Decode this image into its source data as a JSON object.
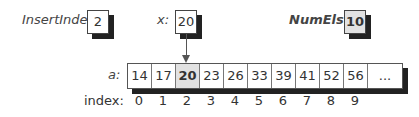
{
  "variables": [
    {
      "name": "InsertIndex:",
      "value": "2"
    },
    {
      "name": "x:",
      "value": "20"
    },
    {
      "name": "NumEls:",
      "value": "10"
    }
  ],
  "array": {
    "label": "a:",
    "cells": [
      "14",
      "17",
      "20",
      "23",
      "26",
      "33",
      "39",
      "41",
      "52",
      "56",
      "..."
    ],
    "highlighted_index": 2
  },
  "index_row": {
    "label": "index:",
    "values": [
      "0",
      "1",
      "2",
      "3",
      "4",
      "5",
      "6",
      "7",
      "8",
      "9"
    ]
  },
  "colors": {
    "highlight_fill": "#e2e2e2",
    "shadow": "#222222",
    "border": "#444444"
  }
}
